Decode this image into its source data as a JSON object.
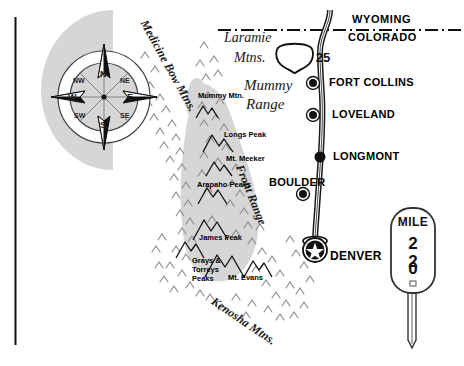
{
  "map": {
    "title": "Colorado Front Range Reference Map",
    "colors": {
      "shade": "#d6d6d6",
      "shade_dark": "#cfcfcf",
      "ink": "#000000",
      "road_fill": "#ffffff",
      "road_stroke": "#1a1a1a"
    },
    "states": [
      {
        "name": "WYOMING"
      },
      {
        "name": "COLORADO"
      }
    ],
    "highway": {
      "shield_label": "25",
      "shield_type": "interstate-shield"
    },
    "cities": [
      {
        "name": "FORT COLLINS",
        "marker": "dot"
      },
      {
        "name": "LOVELAND",
        "marker": "dot"
      },
      {
        "name": "LONGMONT",
        "marker": "dot"
      },
      {
        "name": "BOULDER",
        "marker": "dot"
      },
      {
        "name": "DENVER",
        "marker": "star-capital"
      }
    ],
    "ranges": [
      {
        "name": "Medicine Bow Mtns.",
        "style": "rotated"
      },
      {
        "name": "Laramie",
        "style": "italic"
      },
      {
        "name": "Mtns.",
        "style": "italic"
      },
      {
        "name": "Mummy",
        "style": "italic"
      },
      {
        "name": "Range",
        "style": "italic"
      },
      {
        "name": "Front Range",
        "style": "rotated"
      },
      {
        "name": "Kenosha Mtns.",
        "style": "rotated"
      }
    ],
    "peaks": [
      {
        "name": "Mummy Mtn."
      },
      {
        "name": "Longs Peak"
      },
      {
        "name": "Mt. Meeker"
      },
      {
        "name": "Arapaho Peaks"
      },
      {
        "name": "James Peak"
      },
      {
        "name": "Grays &"
      },
      {
        "name": "Torreys"
      },
      {
        "name": "Peaks"
      },
      {
        "name": "Mt. Evans"
      }
    ],
    "compass": {
      "name": "compass-rose",
      "directions": [
        "N",
        "NE",
        "E",
        "SE",
        "S",
        "SW",
        "W",
        "NW"
      ]
    },
    "mile_marker": {
      "word": "MILE",
      "digits": [
        "2",
        "2",
        "0"
      ]
    }
  }
}
